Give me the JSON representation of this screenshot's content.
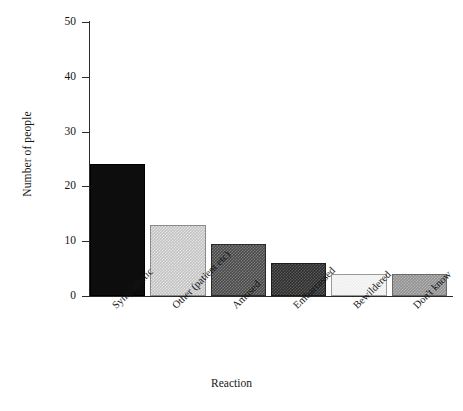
{
  "chart_data": {
    "type": "bar",
    "title": "",
    "xlabel": "Reaction",
    "ylabel": "Number of people",
    "categories": [
      "Sympathetic",
      "Other (patient etc)",
      "Amused",
      "Embarrassed",
      "Bewildered",
      "Don't know"
    ],
    "values": [
      24,
      13,
      9.5,
      6,
      4,
      4
    ],
    "ylim": [
      0,
      50
    ],
    "yticks": [
      0,
      10,
      20,
      30,
      40,
      50
    ],
    "ytick_labels": [
      "0",
      "10",
      "20",
      "30",
      "40",
      "50"
    ],
    "grid": false,
    "legend": "none",
    "bar_fills": [
      "solid-black",
      "light-checker",
      "mid-dark-checker",
      "dark-checker",
      "very-light-checker",
      "medium-checker"
    ],
    "bar_colors": [
      "#0d0d0d",
      "#c2c2c2",
      "#4a4a4a",
      "#2e2e2e",
      "#ededed",
      "#909090"
    ]
  },
  "axes": {
    "y_title": "Number of people",
    "x_title": "Reaction"
  }
}
